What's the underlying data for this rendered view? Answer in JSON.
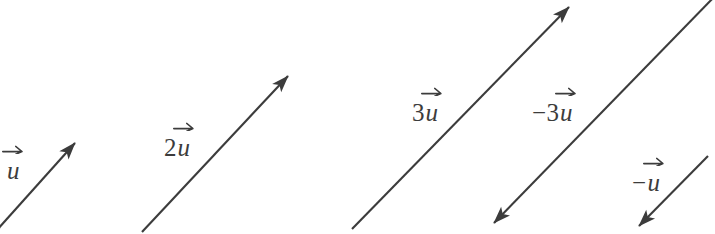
{
  "figure": {
    "background_color": "#ffffff",
    "stroke_color": "#3c3c3c",
    "text_color": "#3c3c3c",
    "width": 715,
    "height": 234
  },
  "vectors": [
    {
      "id": "u",
      "label_scalar": "",
      "label_symbol": "u",
      "label_full": "u⃗",
      "scalar": 1,
      "direction": "up-right",
      "tail": {
        "x": -12,
        "y": 240
      },
      "tip": {
        "x": 75,
        "y": 143
      },
      "label_pos": {
        "x": 6,
        "y": 158
      }
    },
    {
      "id": "2u",
      "label_scalar": "2",
      "label_symbol": "u",
      "label_full": "2u⃗",
      "scalar": 2,
      "direction": "up-right",
      "tail": {
        "x": 142,
        "y": 232
      },
      "tip": {
        "x": 288,
        "y": 76
      },
      "label_pos": {
        "x": 164,
        "y": 135
      }
    },
    {
      "id": "3u",
      "label_scalar": "3",
      "label_symbol": "u",
      "label_full": "3u⃗",
      "scalar": 3,
      "direction": "up-right",
      "tail": {
        "x": 352,
        "y": 229
      },
      "tip": {
        "x": 569,
        "y": 7
      },
      "label_pos": {
        "x": 412,
        "y": 100
      }
    },
    {
      "id": "-3u",
      "label_scalar": "3",
      "label_symbol": "u",
      "label_sign": "−",
      "label_full": "−3u⃗",
      "scalar": -3,
      "direction": "down-left",
      "tail": {
        "x": 716,
        "y": -5
      },
      "tip": {
        "x": 494,
        "y": 223
      },
      "label_pos": {
        "x": 532,
        "y": 100
      }
    },
    {
      "id": "-u",
      "label_scalar": "",
      "label_symbol": "u",
      "label_sign": "−",
      "label_full": "−u⃗",
      "scalar": -1,
      "direction": "down-left",
      "tail": {
        "x": 708,
        "y": 156
      },
      "tip": {
        "x": 639,
        "y": 226
      },
      "label_pos": {
        "x": 632,
        "y": 170
      }
    }
  ]
}
